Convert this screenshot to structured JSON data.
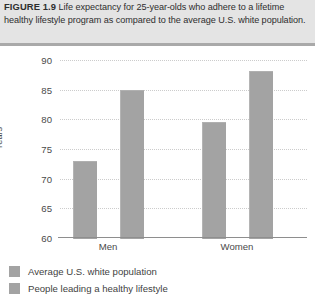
{
  "figure": {
    "label": "FIGURE 1.9",
    "caption": "Life expectancy for 25-year-olds who adhere to a lifetime healthy lifestyle program as compared to the average U.S. white population."
  },
  "colors": {
    "bar_fill": "#a3a3a3",
    "caption_band": "#e4e4e4",
    "gridline": "#cccccc",
    "axis_line": "#8e8e8e"
  },
  "chart_data": {
    "type": "bar",
    "title": "",
    "xlabel": "",
    "ylabel": "Years",
    "categories": [
      "Men",
      "Women"
    ],
    "ylim": [
      60,
      90
    ],
    "yticks": [
      60,
      65,
      70,
      75,
      80,
      85,
      90
    ],
    "grid": true,
    "legend_position": "below",
    "series": [
      {
        "name": "Average U.S. white population",
        "values": [
          73,
          79.6
        ]
      },
      {
        "name": "People leading a healthy lifestyle",
        "values": [
          85,
          88.2
        ]
      }
    ]
  }
}
